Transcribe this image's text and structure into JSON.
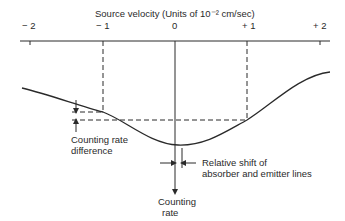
{
  "title": "Source velocity (Units of 10⁻² cm/sec)",
  "axis": {
    "ticks": [
      {
        "label": "− 2",
        "value": -2
      },
      {
        "label": "− 1",
        "value": -1
      },
      {
        "label": "0",
        "value": 0
      },
      {
        "label": "+ 1",
        "value": 1
      },
      {
        "label": "+ 2",
        "value": 2
      }
    ]
  },
  "annotations": {
    "counting_rate_difference_1": "Counting rate",
    "counting_rate_difference_2": "difference",
    "relative_shift_1": "Relative shift of",
    "relative_shift_2": "absorber and emitter lines",
    "counting_rate_axis_1": "Counting",
    "counting_rate_axis_2": "rate"
  },
  "colors": {
    "line": "#2a2a2a",
    "background": "#ffffff"
  }
}
